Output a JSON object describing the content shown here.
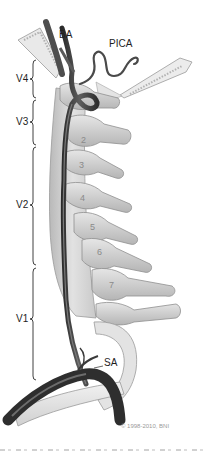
{
  "figure": {
    "labels": {
      "basilar_artery": "BA",
      "pica": "PICA",
      "subclavian_artery": "SA"
    },
    "segments": [
      {
        "label": "V4",
        "top": 60,
        "bottom": 98
      },
      {
        "label": "V3",
        "top": 100,
        "bottom": 145
      },
      {
        "label": "V2",
        "top": 147,
        "bottom": 265
      },
      {
        "label": "V1",
        "top": 268,
        "bottom": 380
      }
    ],
    "vertebra_numbers": [
      "2",
      "3",
      "4",
      "5",
      "6",
      "7"
    ],
    "copyright": "© 1998-2010, BNI"
  },
  "colors": {
    "background": "#ffffff",
    "bone": "#d9d9d9",
    "bone_shadow": "#a8a8a8",
    "artery": "#4a4a4a",
    "artery_dark": "#2c2c2c",
    "label_text": "#1e1e1e"
  }
}
